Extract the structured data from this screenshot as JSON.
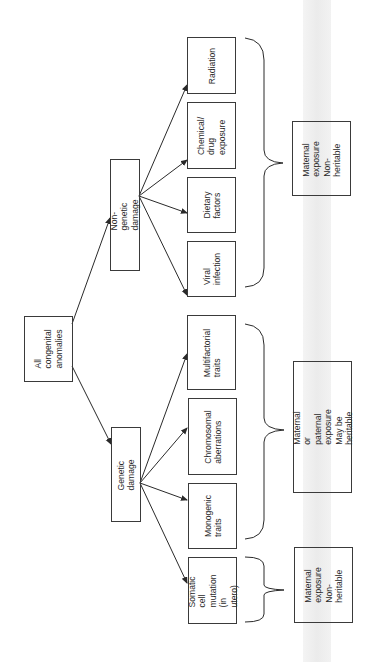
{
  "diagram": {
    "root": {
      "label": "All\ncongenital\nanomalies"
    },
    "categories": [
      {
        "id": "non_genetic",
        "label": "Non-genetic damage"
      },
      {
        "id": "genetic",
        "label": "Genetic  damage"
      }
    ],
    "leaves": {
      "radiation": "Radiation",
      "chemical": "Chemical/\ndrug\nexposure",
      "dietary": "Dietary\nfactors",
      "viral": "Viral\ninfection",
      "multifactorial": "Multifactorial\ntraits",
      "chromosomal": "Chromosomal\naberrations",
      "monogenic": "Monogenic\ntraits",
      "somatic": "Somatic  cell\nmutation\n(in utero)"
    },
    "notes": {
      "non_genetic": "Maternal\nexposure\nNon-heritable",
      "genetic": "Maternal  or  paternal\nexposure\nMay be heritable",
      "somatic": "Maternal\nexposure\nNon-heritable"
    },
    "colors": {
      "line": "#2a2a2a",
      "text": "#2a2a2a",
      "strip": "#ececec"
    }
  }
}
